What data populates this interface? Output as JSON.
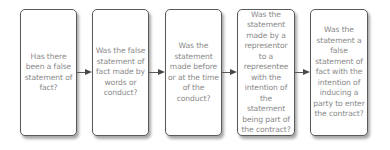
{
  "diagram": {
    "type": "flowchart",
    "direction": "left-to-right",
    "steps": [
      {
        "text": "Has there been a false statement of fact?"
      },
      {
        "text": "Was the false statement of fact made by words or conduct?"
      },
      {
        "text": "Was the statement made before or at the time of the conduct?"
      },
      {
        "text": "Was the statement made by a representor to a representee with the intention of the statement being part of the contract?"
      },
      {
        "text": "Was the statement a false statement of fact with the intention of inducing a party to enter the contract?"
      }
    ],
    "connectors": [
      {
        "from": 0,
        "to": 1
      },
      {
        "from": 1,
        "to": 2
      },
      {
        "from": 2,
        "to": 3
      },
      {
        "from": 3,
        "to": 4
      }
    ]
  }
}
